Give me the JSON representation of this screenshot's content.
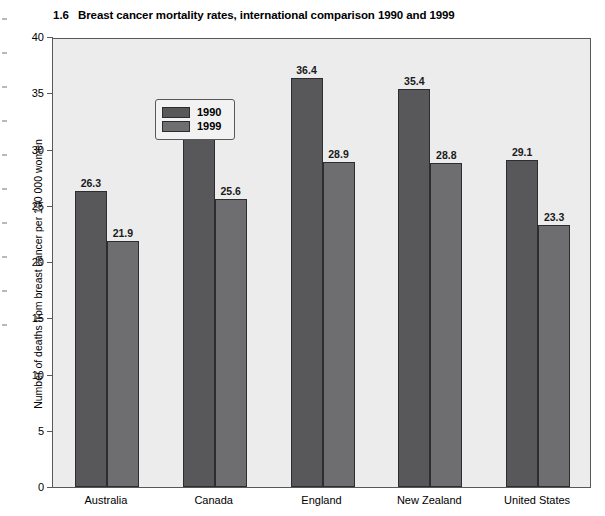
{
  "figure": {
    "number": "1.6",
    "title": "Breast cancer mortality rates, international comparison 1990 and 1999"
  },
  "chart_data": {
    "type": "bar",
    "title": "Breast cancer mortality rates, international comparison 1990 and 1999",
    "xlabel": "",
    "ylabel": "Number of deaths from breast cancer per 100 000 women",
    "ylim": [
      0,
      40
    ],
    "yticks": [
      0,
      5,
      10,
      15,
      20,
      25,
      30,
      35,
      40
    ],
    "ytick_labels": [
      "0",
      "5",
      "10",
      "15",
      "20",
      "25",
      "30",
      "35",
      "40"
    ],
    "grid": false,
    "legend_position": "upper-left-inside",
    "categories": [
      "Australia",
      "Canada",
      "England",
      "New Zealand",
      "United States"
    ],
    "series": [
      {
        "name": "1990",
        "color": "#58585a",
        "values": [
          26.3,
          31.1,
          36.4,
          35.4,
          29.1
        ],
        "labels": [
          "26.3",
          "31.1",
          "36.4",
          "35.4",
          "29.1"
        ]
      },
      {
        "name": "1999",
        "color": "#6e6e70",
        "values": [
          21.9,
          25.6,
          28.9,
          28.8,
          23.3
        ],
        "labels": [
          "21.9",
          "25.6",
          "28.9",
          "28.8",
          "23.3"
        ]
      }
    ]
  }
}
